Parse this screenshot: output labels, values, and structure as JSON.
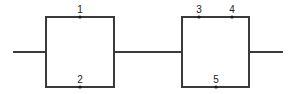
{
  "diagram": {
    "type": "series-parallel network",
    "canvas": {
      "width": 296,
      "height": 94
    },
    "colors": {
      "line": "#3a3a3a",
      "node": "#1a1a1a",
      "label": "#222222",
      "background": "#ffffff"
    },
    "blocks": [
      {
        "id": "block-1",
        "rect": {
          "x1": 46,
          "y1": 17,
          "x2": 114,
          "y2": 87
        },
        "top_branch_nodes": [
          "1"
        ],
        "bottom_branch_nodes": [
          "2"
        ]
      },
      {
        "id": "block-2",
        "rect": {
          "x1": 182,
          "y1": 17,
          "x2": 249,
          "y2": 87
        },
        "top_branch_nodes": [
          "3",
          "4"
        ],
        "bottom_branch_nodes": [
          "5"
        ]
      }
    ],
    "wires": [
      {
        "id": "input-wire",
        "x1": 13,
        "y1": 52,
        "x2": 46,
        "y2": 52
      },
      {
        "id": "link-wire",
        "x1": 114,
        "y1": 52,
        "x2": 182,
        "y2": 52
      },
      {
        "id": "output-wire",
        "x1": 249,
        "y1": 52,
        "x2": 283,
        "y2": 52
      }
    ],
    "nodes": [
      {
        "label": "1",
        "x": 80,
        "y": 17
      },
      {
        "label": "2",
        "x": 80,
        "y": 87
      },
      {
        "label": "3",
        "x": 199,
        "y": 17
      },
      {
        "label": "4",
        "x": 232,
        "y": 17
      },
      {
        "label": "5",
        "x": 216,
        "y": 87
      }
    ]
  }
}
